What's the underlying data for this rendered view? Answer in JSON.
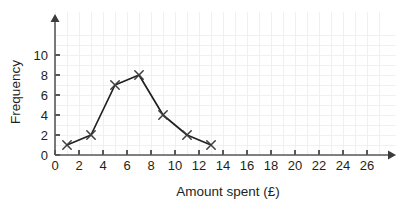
{
  "chart_data": {
    "type": "line",
    "title": "",
    "subtitle": "",
    "xlabel": "Amount spent (£)",
    "ylabel": "Frequency",
    "xlim": [
      0,
      26
    ],
    "ylim": [
      0,
      10
    ],
    "x_ticks": [
      0,
      2,
      4,
      6,
      8,
      10,
      12,
      14,
      16,
      18,
      20,
      22,
      24,
      26
    ],
    "y_ticks": [
      0,
      2,
      4,
      6,
      8,
      10
    ],
    "x_tick_labels": [
      "0",
      "2",
      "4",
      "6",
      "8",
      "10",
      "12",
      "14",
      "16",
      "18",
      "20",
      "22",
      "24",
      "26"
    ],
    "y_tick_labels": [
      "0",
      "2",
      "4",
      "6",
      "8",
      "10"
    ],
    "grid": true,
    "legend": false,
    "legend_position": "none",
    "marker": "x",
    "line_color": "#231f20",
    "marker_color": "#3d3d3f",
    "grid_color": "#f0f0f2",
    "axis_color": "#58595b",
    "background_color": "#ffffff",
    "x": [
      1,
      3,
      5,
      7,
      9,
      11,
      13
    ],
    "values": [
      1,
      2,
      7,
      8,
      4,
      2,
      1
    ],
    "series": [
      {
        "name": "Frequency",
        "points": [
          {
            "x": 1,
            "y": 1
          },
          {
            "x": 3,
            "y": 2
          },
          {
            "x": 5,
            "y": 7
          },
          {
            "x": 7,
            "y": 8
          },
          {
            "x": 9,
            "y": 4
          },
          {
            "x": 11,
            "y": 2
          },
          {
            "x": 13,
            "y": 1
          }
        ]
      }
    ],
    "annotations": []
  },
  "axes": {
    "x_axis_label": "Amount spent (£)",
    "y_axis_label": "Frequency"
  }
}
